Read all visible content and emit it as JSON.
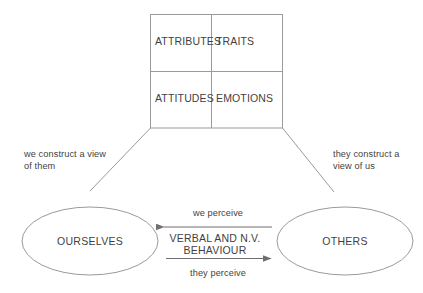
{
  "diagram": {
    "title_present": false,
    "background_color": "#ffffff",
    "stroke_color": "#8a8a8a",
    "text_color": "#3f3f3f",
    "grid": {
      "name": "attribute-grid",
      "cells": [
        {
          "label": "ATTRIBUTES",
          "row": 0,
          "col": 0
        },
        {
          "label": "TRAITS",
          "row": 0,
          "col": 1
        },
        {
          "label": "ATTITUDES",
          "row": 1,
          "col": 0
        },
        {
          "label": "EMOTIONS",
          "row": 1,
          "col": 1
        }
      ]
    },
    "nodes": [
      {
        "id": "ourselves",
        "label": "OURSELVES",
        "shape": "ellipse"
      },
      {
        "id": "others",
        "label": "OTHERS",
        "shape": "ellipse"
      }
    ],
    "connector_notes": [
      {
        "id": "left-note",
        "line1": "we construct a view",
        "line2": "of them"
      },
      {
        "id": "right-note",
        "line1": "they construct a",
        "line2": "view of us"
      }
    ],
    "arrows": [
      {
        "id": "we-perceive",
        "label": "we perceive",
        "direction": "left"
      },
      {
        "id": "they-perceive",
        "label": "they perceive",
        "direction": "right"
      }
    ],
    "center_label": {
      "line1": "VERBAL AND N.V.",
      "line2": "BEHAVIOUR"
    }
  }
}
